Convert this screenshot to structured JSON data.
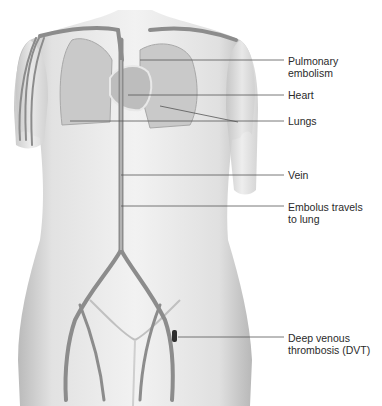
{
  "figure": {
    "labels": [
      {
        "id": "pulmonary-embolism",
        "text": "Pulmonary\nembolism",
        "top": 57
      },
      {
        "id": "heart",
        "text": "Heart",
        "top": 89
      },
      {
        "id": "lungs",
        "text": "Lungs",
        "top": 116
      },
      {
        "id": "vein",
        "text": "Vein",
        "top": 168
      },
      {
        "id": "embolus",
        "text": "Embolus travels\nto lung",
        "top": 201
      },
      {
        "id": "dvt",
        "text": "Deep venous\nthrombosis (DVT)",
        "top": 334
      }
    ],
    "colors": {
      "skin": "#e6e6e6",
      "skin_shadow": "#bdbdbd",
      "lung": "#c8c8c8",
      "vessel": "#8c8c8c",
      "vessel_light": "#d8d8d8",
      "clot": "#2e2e2e",
      "leader": "#555555"
    }
  }
}
